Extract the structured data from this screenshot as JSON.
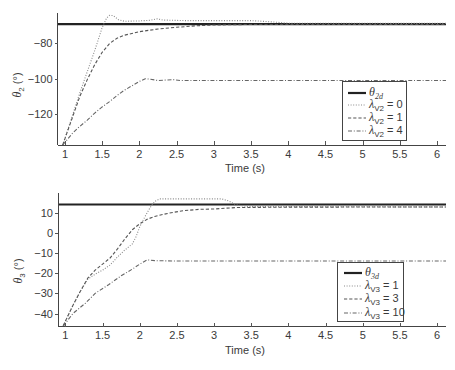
{
  "chart_data": [
    {
      "type": "line",
      "title": "",
      "xlabel": "Time (s)",
      "ylabel": "θ2 (°)",
      "ylabel_parts": {
        "symbol": "θ",
        "sub": "2",
        "unit": "(°)"
      },
      "xlim": [
        0.9,
        6.12
      ],
      "ylim": [
        -137.6,
        -62.7
      ],
      "grid": false,
      "legend_position": "inside lower right",
      "xticks": [
        1,
        1.5,
        2,
        2.5,
        3,
        3.5,
        4,
        4.5,
        5,
        5.5,
        6
      ],
      "xtick_labels": [
        "1",
        "1.5",
        "2",
        "2.5",
        "3",
        "3.5",
        "4",
        "4.5",
        "5",
        "5.5",
        "6"
      ],
      "yticks": [
        -120,
        -100,
        -80
      ],
      "ytick_labels": [
        "−120",
        "−100",
        "−80"
      ],
      "series": [
        {
          "name": "θ2d",
          "style": "solid",
          "legend": {
            "symbol": "θ",
            "sub": "2d",
            "suffix": ""
          },
          "x": [
            0.9,
            6.12
          ],
          "values": [
            -69,
            -69
          ]
        },
        {
          "name": "λV2 = 0",
          "style": "dotted",
          "legend": {
            "symbol": "λ",
            "sub": "V2",
            "suffix": " = 0"
          },
          "x": [
            0.97,
            1.1,
            1.2,
            1.3,
            1.4,
            1.5,
            1.56,
            1.6,
            1.65,
            1.72,
            1.8,
            2.0,
            2.15,
            2.24,
            2.32,
            2.6,
            3.5,
            3.8,
            4.0,
            6.12
          ],
          "values": [
            -137.6,
            -121,
            -108,
            -96,
            -84,
            -71,
            -65.5,
            -64,
            -64.2,
            -66.5,
            -67.4,
            -67.2,
            -66.8,
            -66,
            -66.7,
            -67,
            -67,
            -67.8,
            -68.5,
            -68.6
          ]
        },
        {
          "name": "λV2 = 1",
          "style": "dashed",
          "legend": {
            "symbol": "λ",
            "sub": "V2",
            "suffix": " = 1"
          },
          "x": [
            0.97,
            1.1,
            1.2,
            1.3,
            1.4,
            1.5,
            1.6,
            1.7,
            1.8,
            2.0,
            2.25,
            2.5,
            2.75,
            3.0,
            3.5,
            6.12
          ],
          "values": [
            -137.6,
            -122,
            -110,
            -100.5,
            -92,
            -85,
            -80,
            -77,
            -75.3,
            -73.3,
            -71.8,
            -70.8,
            -70,
            -69.5,
            -69.2,
            -69.2
          ]
        },
        {
          "name": "λV2 = 4",
          "style": "dashdot",
          "legend": {
            "symbol": "λ",
            "sub": "V2",
            "suffix": " = 4"
          },
          "x": [
            0.97,
            1.1,
            1.2,
            1.3,
            1.4,
            1.5,
            1.6,
            1.7,
            1.8,
            1.9,
            2.0,
            2.08,
            2.15,
            2.25,
            2.45,
            2.55,
            6.12
          ],
          "values": [
            -137.6,
            -131,
            -127,
            -123.5,
            -119.5,
            -116,
            -113,
            -109.5,
            -106.5,
            -104,
            -101.5,
            -100,
            -100.3,
            -101,
            -100.5,
            -101,
            -101
          ]
        }
      ]
    },
    {
      "type": "line",
      "title": "",
      "xlabel": "Time (s)",
      "ylabel": "θ3 (°)",
      "ylabel_parts": {
        "symbol": "θ",
        "sub": "3",
        "unit": "(°)"
      },
      "xlim": [
        0.9,
        6.12
      ],
      "ylim": [
        -46.4,
        19.7
      ],
      "grid": false,
      "legend_position": "inside lower right",
      "xticks": [
        1,
        1.5,
        2,
        2.5,
        3,
        3.5,
        4,
        4.5,
        5,
        5.5,
        6
      ],
      "xtick_labels": [
        "1",
        "1.5",
        "2",
        "2.5",
        "3",
        "3.5",
        "4",
        "4.5",
        "5",
        "5.5",
        "6"
      ],
      "yticks": [
        -40,
        -30,
        -20,
        -10,
        0,
        10
      ],
      "ytick_labels": [
        "−40",
        "−30",
        "−20",
        "−10",
        "0",
        "10"
      ],
      "series": [
        {
          "name": "θ3d",
          "style": "solid",
          "legend": {
            "symbol": "θ",
            "sub": "3d",
            "suffix": ""
          },
          "x": [
            0.9,
            6.12
          ],
          "values": [
            14,
            14
          ]
        },
        {
          "name": "λV3 = 1",
          "style": "dotted",
          "legend": {
            "symbol": "λ",
            "sub": "V3",
            "suffix": " = 1"
          },
          "x": [
            0.97,
            1.1,
            1.2,
            1.3,
            1.4,
            1.5,
            1.6,
            1.7,
            1.8,
            1.9,
            1.95,
            2.0,
            2.07,
            2.14,
            2.2,
            2.27,
            3.1,
            3.2,
            3.3,
            3.45,
            6.12
          ],
          "values": [
            -46,
            -36,
            -29,
            -23,
            -20.5,
            -18.5,
            -16,
            -12,
            -8.5,
            -5.5,
            -2,
            3,
            8,
            12.5,
            15.5,
            16.8,
            16.8,
            15.7,
            13.8,
            13,
            12.8
          ]
        },
        {
          "name": "λV3 = 3",
          "style": "dashed",
          "legend": {
            "symbol": "λ",
            "sub": "V3",
            "suffix": " = 3"
          },
          "x": [
            0.97,
            1.1,
            1.2,
            1.3,
            1.4,
            1.5,
            1.6,
            1.7,
            1.8,
            1.9,
            2.0,
            2.1,
            2.2,
            2.4,
            2.6,
            2.8,
            3.0,
            3.3,
            4.0,
            6.12
          ],
          "values": [
            -46,
            -36,
            -29,
            -22.5,
            -18.5,
            -15.5,
            -12.5,
            -8,
            -3,
            1.5,
            4.5,
            6.7,
            8.1,
            9.8,
            11,
            11.6,
            11.8,
            12.5,
            12.7,
            12.8
          ]
        },
        {
          "name": "λV3 = 10",
          "style": "dashdot",
          "legend": {
            "symbol": "λ",
            "sub": "V3",
            "suffix": " = 10"
          },
          "x": [
            0.97,
            1.1,
            1.27,
            1.4,
            1.58,
            1.75,
            1.9,
            2.0,
            2.1,
            2.2,
            2.5,
            3.0,
            6.12
          ],
          "values": [
            -46.3,
            -40,
            -34.8,
            -30,
            -25.7,
            -21.3,
            -18,
            -15.5,
            -13.4,
            -13.8,
            -14,
            -14,
            -14
          ]
        }
      ]
    }
  ]
}
